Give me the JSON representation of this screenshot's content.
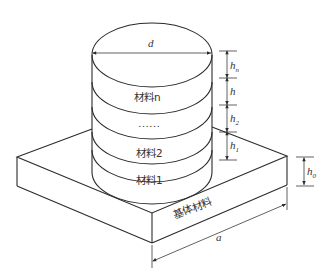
{
  "diagram": {
    "type": "multilayer-cylinder-on-substrate",
    "labels": {
      "diameter": "d",
      "layer_n": "材料n",
      "ellipsis": "……",
      "layer_2": "材料2",
      "layer_1": "材料1",
      "substrate": "基体材料",
      "substrate_width": "a"
    },
    "heights": {
      "hn": "h",
      "hn_sub": "n",
      "h": "h",
      "h2": "h",
      "h2_sub": "2",
      "h1": "h",
      "h1_sub": "1",
      "h0": "h",
      "h0_sub": "0"
    },
    "colors": {
      "line": "#2b2b2b",
      "text": "#333333",
      "background": "#ffffff"
    }
  }
}
